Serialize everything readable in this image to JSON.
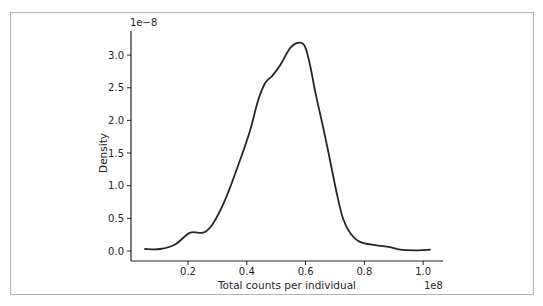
{
  "chart_data": {
    "type": "line",
    "title": "",
    "xlabel": "Total counts per individual",
    "ylabel": "Density",
    "x_offset_label": "1e8",
    "y_offset_label": "1e−8",
    "xlim": [
      0.03,
      1.07
    ],
    "ylim": [
      -0.1,
      3.35
    ],
    "grid": false,
    "legend": null,
    "x_ticks": [
      0.2,
      0.4,
      0.6,
      0.8,
      1.0
    ],
    "x_tick_labels": [
      "0.2",
      "0.4",
      "0.6",
      "0.8",
      "1.0"
    ],
    "y_ticks": [
      0.0,
      0.5,
      1.0,
      1.5,
      2.0,
      2.5,
      3.0
    ],
    "y_tick_labels": [
      "0.0",
      "0.5",
      "1.0",
      "1.5",
      "2.0",
      "2.5",
      "3.0"
    ],
    "series": [
      {
        "name": "KDE density",
        "color": "#262626",
        "x": [
          0.054,
          0.105,
          0.156,
          0.207,
          0.251,
          0.282,
          0.326,
          0.377,
          0.411,
          0.438,
          0.462,
          0.486,
          0.514,
          0.548,
          0.578,
          0.598,
          0.615,
          0.635,
          0.659,
          0.683,
          0.707,
          0.727,
          0.751,
          0.785,
          0.836,
          0.887,
          0.921,
          0.972,
          1.023
        ],
        "y": [
          0.03,
          0.03,
          0.1,
          0.28,
          0.28,
          0.4,
          0.78,
          1.39,
          1.84,
          2.3,
          2.57,
          2.68,
          2.85,
          3.11,
          3.19,
          3.13,
          2.85,
          2.39,
          1.91,
          1.39,
          0.86,
          0.5,
          0.28,
          0.14,
          0.09,
          0.06,
          0.02,
          0.01,
          0.02
        ]
      }
    ]
  }
}
